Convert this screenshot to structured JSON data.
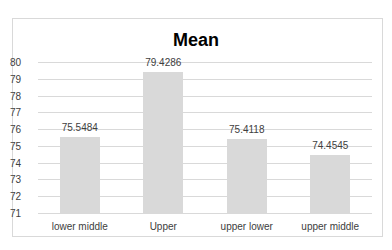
{
  "chart_data": {
    "type": "bar",
    "title": "Mean",
    "categories": [
      "lower middle",
      "Upper",
      "upper lower",
      "upper middle"
    ],
    "values": [
      75.5484,
      79.4286,
      75.4118,
      74.4545
    ],
    "value_labels": [
      "75.5484",
      "79.4286",
      "75.4118",
      "74.4545"
    ],
    "xlabel": "",
    "ylabel": "",
    "ylim": [
      71,
      80
    ],
    "yticks": [
      80,
      79,
      78,
      77,
      76,
      75,
      74,
      73,
      72,
      71
    ],
    "grid": true,
    "legend": "none",
    "bar_color": "#d9d9d9"
  }
}
